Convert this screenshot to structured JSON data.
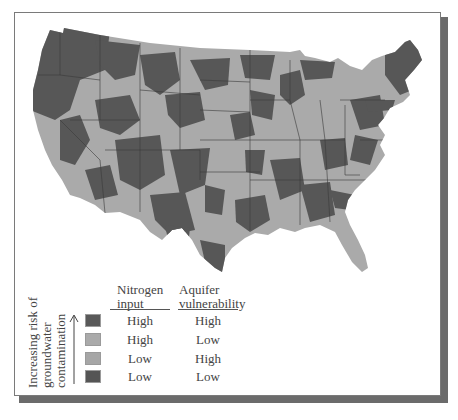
{
  "figure": {
    "type": "choropleth map",
    "region": "Contiguous United States",
    "colors": {
      "high_high": "#595959",
      "high_low": "#aaaaaa",
      "low_high": "#a6a6a6",
      "low_low": "#555555",
      "state_border": "#3a3a3a",
      "frame_shadow": "#6b6b6b"
    }
  },
  "legend": {
    "axis_label_lines": [
      "Increasing risk of",
      "groundwater",
      "contamination"
    ],
    "arrow_icon": "up-arrow",
    "columns": {
      "nitrogen_line1": "Nitrogen",
      "nitrogen_line2": "input",
      "aquifer_line1": "Aquifer",
      "aquifer_line2": "vulnerability"
    },
    "rows": [
      {
        "nitrogen": "High",
        "aquifer": "High",
        "color": "#595959"
      },
      {
        "nitrogen": "High",
        "aquifer": "Low",
        "color": "#aaaaaa"
      },
      {
        "nitrogen": "Low",
        "aquifer": "High",
        "color": "#a6a6a6"
      },
      {
        "nitrogen": "Low",
        "aquifer": "Low",
        "color": "#555555"
      }
    ]
  }
}
